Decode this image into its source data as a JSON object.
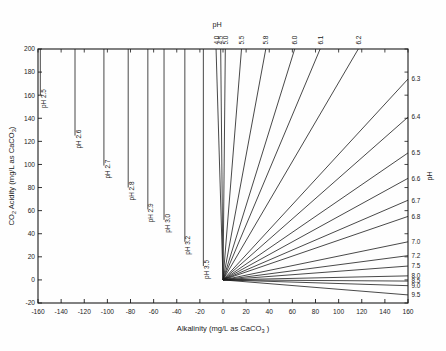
{
  "chart_data": {
    "type": "line",
    "title": "",
    "xlabel": "Alkalinity (mg/L as CaCO3 )",
    "xlabel_parts": {
      "main": "Alkalinity (mg/L as CaCO",
      "sub": "3",
      "tail": " )"
    },
    "ylabel": "CO2 Acidity (mg/L as CaCO3)",
    "ylabel_parts": {
      "pre": "CO",
      "sub1": "2",
      "mid": " Acidity (mg/L as CaCO",
      "sub2": "3",
      "post": ")"
    },
    "xlim": [
      -160,
      160
    ],
    "ylim": [
      -20,
      200
    ],
    "xticks": [
      -160,
      -140,
      -120,
      -100,
      -80,
      -60,
      -40,
      -20,
      0,
      20,
      40,
      60,
      80,
      100,
      120,
      140,
      160
    ],
    "xtick_labels": [
      "-160",
      "-140",
      "-120",
      "-100",
      "-80",
      "-60",
      "-40",
      "-20",
      "0",
      "20",
      "40",
      "60",
      "80",
      "100",
      "120",
      "140",
      "160"
    ],
    "yticks": [
      -20,
      0,
      20,
      40,
      60,
      80,
      100,
      120,
      140,
      160,
      180,
      200
    ],
    "ytick_labels": [
      "-20",
      "0",
      "20",
      "40",
      "60",
      "80",
      "100",
      "120",
      "140",
      "160",
      "180",
      "200"
    ],
    "grid": false,
    "legend": "none",
    "top_axis_label": "pH",
    "right_axis_label": "pH",
    "series": [
      {
        "name": "pH 2.5",
        "label": "pH 2.5",
        "label_side": "left",
        "x0": -158.0,
        "y0": 200,
        "x1": -158.0,
        "y1": 160,
        "kind": "vertical"
      },
      {
        "name": "pH 2.6",
        "label": "pH 2.6",
        "label_side": "left",
        "x0": -128.0,
        "y0": 200,
        "x1": -128.0,
        "y1": 125,
        "kind": "vertical"
      },
      {
        "name": "pH 2.7",
        "label": "pH 2.7",
        "label_side": "left",
        "x0": -103.0,
        "y0": 200,
        "x1": -103.0,
        "y1": 99,
        "kind": "vertical"
      },
      {
        "name": "pH 2.8",
        "label": "pH 2.8",
        "label_side": "left",
        "x0": -82.0,
        "y0": 200,
        "x1": -82.0,
        "y1": 80,
        "kind": "vertical"
      },
      {
        "name": "pH 2.9",
        "label": "pH 2.9",
        "label_side": "left",
        "x0": -65.0,
        "y0": 200,
        "x1": -65.0,
        "y1": 61,
        "kind": "vertical"
      },
      {
        "name": "pH 3.0",
        "label": "pH 3.0",
        "label_side": "left",
        "x0": -51.0,
        "y0": 200,
        "x1": -51.0,
        "y1": 52,
        "kind": "vertical"
      },
      {
        "name": "pH 3.2",
        "label": "pH 3.2",
        "label_side": "left",
        "x0": -33.0,
        "y0": 200,
        "x1": -33.0,
        "y1": 33,
        "kind": "vertical"
      },
      {
        "name": "pH 3.5",
        "label": "pH 3.5",
        "label_side": "left",
        "x0": -17.0,
        "y0": 200,
        "x1": -17.0,
        "y1": 12,
        "kind": "vertical"
      },
      {
        "name": "pH 4.0",
        "label": "4.0",
        "label_side": "top",
        "x0": 0,
        "y0": 0,
        "x1": -6.0,
        "y1": 200,
        "kind": "radial"
      },
      {
        "name": "pH 4.5",
        "label": "4.5",
        "label_side": "top",
        "x0": 0,
        "y0": 0,
        "x1": -2.0,
        "y1": 200,
        "kind": "radial"
      },
      {
        "name": "pH 5.0",
        "label": "5.0",
        "label_side": "top",
        "x0": 0,
        "y0": 0,
        "x1": 2.0,
        "y1": 200,
        "kind": "radial"
      },
      {
        "name": "pH 5.5",
        "label": "5.5",
        "label_side": "top",
        "x0": 0,
        "y0": 0,
        "x1": 16.0,
        "y1": 200,
        "kind": "radial"
      },
      {
        "name": "pH 5.8",
        "label": "5.8",
        "label_side": "top",
        "x0": 0,
        "y0": 0,
        "x1": 37.0,
        "y1": 200,
        "kind": "radial"
      },
      {
        "name": "pH 6.0",
        "label": "6.0",
        "label_side": "top",
        "x0": 0,
        "y0": 0,
        "x1": 62.0,
        "y1": 200,
        "kind": "radial"
      },
      {
        "name": "pH 6.1",
        "label": "6.1",
        "label_side": "top",
        "x0": 0,
        "y0": 0,
        "x1": 84.0,
        "y1": 200,
        "kind": "radial"
      },
      {
        "name": "pH 6.2",
        "label": "6.2",
        "label_side": "top",
        "x0": 0,
        "y0": 0,
        "x1": 117.0,
        "y1": 200,
        "kind": "radial"
      },
      {
        "name": "pH 6.3",
        "label": "6.3",
        "label_side": "right",
        "x0": 0,
        "y0": 0,
        "x1": 160.0,
        "y1": 174.0,
        "kind": "radial"
      },
      {
        "name": "pH 6.4",
        "label": "6.4",
        "label_side": "right",
        "x0": 0,
        "y0": 0,
        "x1": 160.0,
        "y1": 141.0,
        "kind": "radial"
      },
      {
        "name": "pH 6.5",
        "label": "6.5",
        "label_side": "right",
        "x0": 0,
        "y0": 0,
        "x1": 160.0,
        "y1": 110.0,
        "kind": "radial"
      },
      {
        "name": "pH 6.6",
        "label": "6.6",
        "label_side": "right",
        "x0": 0,
        "y0": 0,
        "x1": 160.0,
        "y1": 88.0,
        "kind": "radial"
      },
      {
        "name": "pH 6.7",
        "label": "6.7",
        "label_side": "right",
        "x0": 0,
        "y0": 0,
        "x1": 160.0,
        "y1": 69.0,
        "kind": "radial"
      },
      {
        "name": "pH 6.8",
        "label": "6.8",
        "label_side": "right",
        "x0": 0,
        "y0": 0,
        "x1": 160.0,
        "y1": 55.0,
        "kind": "radial"
      },
      {
        "name": "pH 7.0",
        "label": "7.0",
        "label_side": "right",
        "x0": 0,
        "y0": 0,
        "x1": 160.0,
        "y1": 33.0,
        "kind": "radial"
      },
      {
        "name": "pH 7.2",
        "label": "7.2",
        "label_side": "right",
        "x0": 0,
        "y0": 0,
        "x1": 160.0,
        "y1": 21.0,
        "kind": "radial"
      },
      {
        "name": "pH 7.5",
        "label": "7.5",
        "label_side": "right",
        "x0": 0,
        "y0": 0,
        "x1": 160.0,
        "y1": 12.0,
        "kind": "radial"
      },
      {
        "name": "pH 8.0",
        "label": "8.0",
        "label_side": "right",
        "x0": 0,
        "y0": 0,
        "x1": 160.0,
        "y1": 3.5,
        "kind": "radial"
      },
      {
        "name": "pH 8.5",
        "label": "8.5",
        "label_side": "right",
        "x0": 0,
        "y0": 0,
        "x1": 160.0,
        "y1": -1.0,
        "kind": "radial"
      },
      {
        "name": "pH 9.0",
        "label": "9.0",
        "label_side": "right",
        "x0": 0,
        "y0": 0,
        "x1": 160.0,
        "y1": -5.0,
        "kind": "radial"
      },
      {
        "name": "pH 9.5",
        "label": "9.5",
        "label_side": "right",
        "x0": 0,
        "y0": 0,
        "x1": 160.0,
        "y1": -13.0,
        "kind": "radial"
      }
    ]
  }
}
